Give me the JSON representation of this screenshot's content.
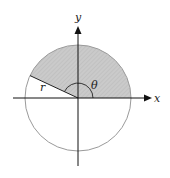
{
  "diagram": {
    "type": "polar-sector",
    "labels": {
      "x_axis": "x",
      "y_axis": "y",
      "radius": "r",
      "angle": "θ"
    },
    "colors": {
      "sector_fill": "#c8c8c8",
      "circle_stroke": "#9a9a9a",
      "axis_stroke": "#111111"
    },
    "sector_angle_deg": 155
  }
}
